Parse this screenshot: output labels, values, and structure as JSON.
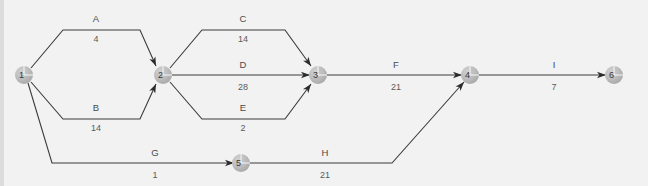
{
  "diagram": {
    "type": "activity-on-arrow-network",
    "background_color": "#f2f2f2",
    "node_color": "#b8b8b8",
    "line_color": "#3b3b3b",
    "text_color": "#4a4a4a",
    "nodes": [
      {
        "id": "1",
        "label": "1",
        "x": 24,
        "y": 75
      },
      {
        "id": "2",
        "label": "2",
        "x": 163,
        "y": 75
      },
      {
        "id": "3",
        "label": "3",
        "x": 318,
        "y": 75
      },
      {
        "id": "4",
        "label": "4",
        "x": 470,
        "y": 75
      },
      {
        "id": "5",
        "label": "5",
        "x": 241,
        "y": 163
      },
      {
        "id": "6",
        "label": "6",
        "x": 614,
        "y": 75
      }
    ],
    "edges": [
      {
        "id": "A",
        "name": "A",
        "duration": "4",
        "from": "1",
        "to": "2",
        "label_x": 96,
        "name_y": 22,
        "dur_y": 42,
        "path": "M31,68 L63,30 L140,30 L156,66"
      },
      {
        "id": "B",
        "name": "B",
        "duration": "14",
        "from": "1",
        "to": "2",
        "label_x": 96,
        "name_y": 111,
        "dur_y": 131,
        "path": "M31,82 L63,119 L140,119 L156,84"
      },
      {
        "id": "C",
        "name": "C",
        "duration": "14",
        "from": "2",
        "to": "3",
        "label_x": 243,
        "name_y": 22,
        "dur_y": 42,
        "path": "M170,68 L202,30 L285,30 L311,66"
      },
      {
        "id": "D",
        "name": "D",
        "duration": "28",
        "from": "2",
        "to": "3",
        "label_x": 243,
        "name_y": 68,
        "dur_y": 90,
        "path": "M172,75 L310,75"
      },
      {
        "id": "E",
        "name": "E",
        "duration": "2",
        "from": "2",
        "to": "3",
        "label_x": 243,
        "name_y": 111,
        "dur_y": 131,
        "path": "M170,82 L202,119 L285,119 L311,84"
      },
      {
        "id": "F",
        "name": "F",
        "duration": "21",
        "from": "3",
        "to": "4",
        "label_x": 396,
        "name_y": 68,
        "dur_y": 90,
        "path": "M327,75 L462,75"
      },
      {
        "id": "G",
        "name": "G",
        "duration": "1",
        "from": "1",
        "to": "5",
        "label_x": 155,
        "name_y": 156,
        "dur_y": 178,
        "path": "M28,83 L52,163 L234,163"
      },
      {
        "id": "H",
        "name": "H",
        "duration": "21",
        "from": "5",
        "to": "4",
        "label_x": 325,
        "name_y": 156,
        "dur_y": 178,
        "path": "M248,163 L392,163 L464,82"
      },
      {
        "id": "I",
        "name": "I",
        "duration": "7",
        "from": "4",
        "to": "6",
        "label_x": 554,
        "name_y": 68,
        "dur_y": 90,
        "path": "M478,75 L606,75"
      }
    ]
  }
}
